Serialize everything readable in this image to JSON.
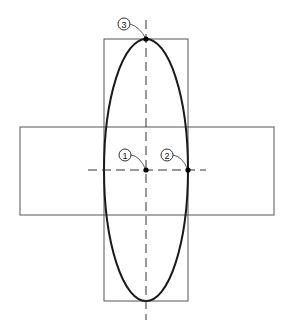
{
  "diagram": {
    "callouts": [
      {
        "id": "1",
        "label": "1",
        "meaning": "ellipse center"
      },
      {
        "id": "2",
        "label": "2",
        "meaning": "end of minor axis"
      },
      {
        "id": "3",
        "label": "3",
        "meaning": "end of major axis"
      }
    ],
    "colors": {
      "ellipse": "#1a1a1a",
      "rectangles": "#555555",
      "center_lines": "#333333",
      "background": "#ffffff"
    }
  }
}
